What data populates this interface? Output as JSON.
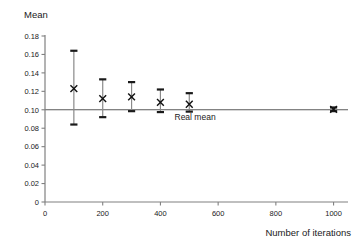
{
  "chart_data": {
    "type": "scatter",
    "title": "",
    "ylabel": "Mean",
    "xlabel": "Number of iterations",
    "xlim": [
      0,
      1050
    ],
    "ylim": [
      0,
      0.18
    ],
    "grid": false,
    "legend": "none",
    "x_ticks": [
      "0",
      "200",
      "400",
      "600",
      "800",
      "1000"
    ],
    "x_tick_values": [
      0,
      200,
      400,
      600,
      800,
      1000
    ],
    "y_ticks": [
      "0",
      "0.02",
      "0.04",
      "0.06",
      "0.08",
      "0.10",
      "0.12",
      "0.14",
      "0.16",
      "0.18"
    ],
    "y_tick_values": [
      0,
      0.02,
      0.04,
      0.06,
      0.08,
      0.1,
      0.12,
      0.14,
      0.16,
      0.18
    ],
    "x": [
      100,
      200,
      300,
      400,
      500,
      1000
    ],
    "values": [
      0.123,
      0.112,
      0.114,
      0.108,
      0.106,
      0.1005
    ],
    "err_low": [
      0.084,
      0.092,
      0.0985,
      0.0975,
      0.098,
      0.0985
    ],
    "err_high": [
      0.164,
      0.133,
      0.13,
      0.122,
      0.118,
      0.1025
    ],
    "marker": "x",
    "annotations": [
      {
        "text": "Real mean",
        "x": 520,
        "y": 0.0885,
        "reference_value": 0.1
      }
    ],
    "reference_line": {
      "value": 0.1,
      "label": "Real mean"
    }
  },
  "colors": {
    "axis": "#808080",
    "reference_line": "#5a5a5a",
    "error_bar": "#8a8a8a",
    "error_cap": "#1a1a1a",
    "marker": "#111111",
    "text": "#1a1a1a",
    "background": "#ffffff"
  }
}
